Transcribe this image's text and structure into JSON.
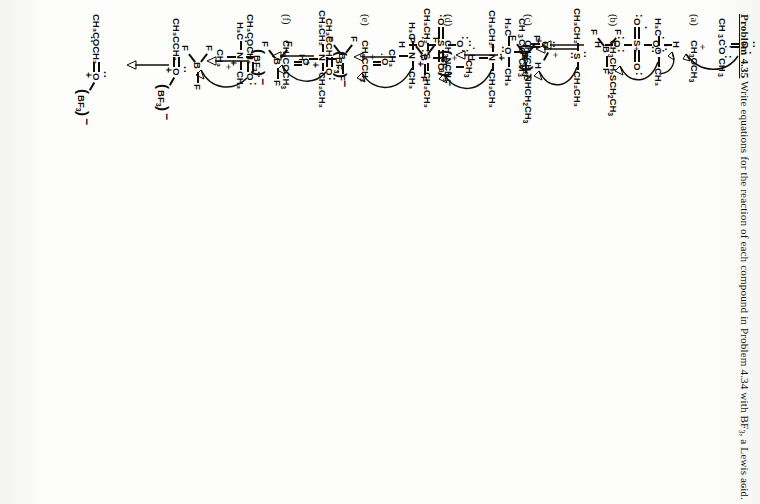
{
  "page": {
    "orientation": "rotated-90-clockwise",
    "background": "#fdfdfc",
    "ink": "#100d08",
    "width": 760,
    "height": 504
  },
  "problem": {
    "number_label": "Problem 4.35",
    "statement": "Write equations for the reaction of each compound in Problem 4.34 with BF",
    "statement_sub": "3",
    "statement_tail": ", a Lewis acid."
  },
  "carryover_reaction": {
    "note": "tail of previous problem: ester protonated by sulfuric acid",
    "reactant_ester": "CH₃COCH₃",
    "reactant_ester_parts": {
      "left": "CH",
      "l_sub": "3",
      "mid": "C",
      "o_label": "O",
      "right": "CH",
      "r_sub": "3"
    },
    "plus": "+",
    "acid_center": "S",
    "acid_oxygens": [
      "O",
      "O",
      "O",
      "O"
    ],
    "acid_h": [
      "H",
      "H"
    ],
    "arrow": "↓",
    "product_cation_plus": "+",
    "product_h": "H",
    "product_anion_center": "S",
    "product_anion_minus": "−"
  },
  "sections": [
    {
      "tag": "(a)",
      "formula": {
        "text": "CH3OCH3",
        "parts": [
          "CH",
          "3",
          "OCH",
          "3"
        ]
      },
      "reactant_label_left": "H₃C",
      "reactant_center": "O",
      "reactant_label_right": "CH₃",
      "plus": "+",
      "lewis_acid_center": "B",
      "lewis_acid_f": [
        "F",
        "F",
        "F"
      ],
      "arrow": "↓",
      "product_left": "H₃C",
      "product_center": "O",
      "product_right": "CH₃",
      "product_charge": "+",
      "counterion": "BF",
      "counterion_sub": "3",
      "counterion_charge": "−",
      "terminal_period": "."
    },
    {
      "tag": "(b)",
      "formula": {
        "text": "CH3CH2SCH2CH3",
        "parts": [
          "CH",
          "3",
          "CH",
          "2",
          "SCH",
          "2",
          "CH",
          "3"
        ]
      },
      "reactant_label_left": "CH₃CH₂",
      "reactant_center": "S",
      "reactant_label_right": "CH₂CH₃",
      "plus": "+",
      "lewis_acid_center": "B",
      "lewis_acid_f": [
        "F",
        "F",
        "F"
      ],
      "arrow": "↓",
      "product_left": "CH₃CH₂",
      "product_center": "S",
      "product_right": "CH₂CH₃",
      "product_charge": "+",
      "counterion": "BF",
      "counterion_sub": "3",
      "counterion_charge": "−",
      "terminal_period": "."
    },
    {
      "tag": "(c)",
      "formula": {
        "text": "CH3CH2NHCH2CH3",
        "parts": [
          "CH",
          "3",
          "CH",
          "2",
          "NHCH",
          "2",
          "CH",
          "3"
        ]
      },
      "reactant_label_left": "CH₃CH₂",
      "reactant_center": "N",
      "reactant_label_right": "CH₂CH₃",
      "reactant_label_below": "H",
      "plus": "+",
      "lewis_acid_center": "B",
      "lewis_acid_f": [
        "F",
        "F",
        "F"
      ],
      "arrow": "↓",
      "product_left": "CH₃CH₂",
      "product_center": "N",
      "product_right": "CH₂CH₃",
      "product_below": "H",
      "product_charge": "+",
      "counterion": "BF",
      "counterion_sub": "3",
      "counterion_charge": "−"
    },
    {
      "tag": "(d)",
      "formula": {
        "text": "CH3NCH3",
        "parts": [
          "CH",
          "3",
          "NCH",
          "3"
        ],
        "branch": "CH",
        "branch_sub": "3"
      },
      "reactant_label_left": "H₃C",
      "reactant_center": "N",
      "reactant_label_right": "CH₃",
      "reactant_label_below": "CH₃",
      "plus": "+",
      "lewis_acid_center": "B",
      "lewis_acid_f": [
        "F",
        "F",
        "F"
      ],
      "arrow": "↓",
      "product_left": "H₃C",
      "product_center": "N",
      "product_right": "CH₃",
      "product_below": "CH₃",
      "product_charge": "+",
      "counterion": "BF",
      "counterion_sub": "3",
      "counterion_charge": "−"
    },
    {
      "tag": "(e)",
      "formula": {
        "text": "CH3CCH3",
        "parts": [
          "CH",
          "3",
          "CCH",
          "3"
        ],
        "carbonyl": "O"
      },
      "reactant_label_left": "CH₃CCH₃",
      "reactant_center": "O",
      "plus": "+",
      "lewis_acid_center": "B",
      "lewis_acid_f": [
        "F",
        "F",
        "F"
      ],
      "arrow": "↓",
      "product_left": "CH₃CCH₃",
      "product_center": "O",
      "product_charge": "+",
      "counterion": "BF",
      "counterion_sub": "3",
      "counterion_charge": "−"
    },
    {
      "tag": "(f)",
      "formula": {
        "text": "CH3COOCH3",
        "parts": [
          "CH",
          "3",
          "COCH",
          "3"
        ],
        "carbonyl": "O"
      },
      "reactant_label_left": "CH₃COCH₃",
      "reactant_center": "O",
      "plus": "+",
      "lewis_acid_center": "B",
      "lewis_acid_f": [
        "F",
        "F",
        "F"
      ],
      "arrow": "↓",
      "product_left": "CH₃COCH₃",
      "product_center": "O",
      "product_charge": "+",
      "counterion": "BF",
      "counterion_sub": "3",
      "counterion_charge": "−"
    }
  ]
}
